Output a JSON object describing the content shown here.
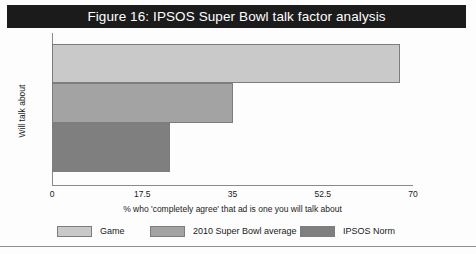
{
  "title": "Figure 16: IPSOS Super Bowl talk factor analysis",
  "colors": {
    "title_bar_background": "#1b1b1b",
    "title_bar_text": "#ffffff",
    "axis_line": "#8a8a8a",
    "bar_outline": "#7d7d7d",
    "game": "#c9c9c9",
    "super_bowl_average": "#a3a3a3",
    "ipsos_norm": "#7f7f7f"
  },
  "chart_data": {
    "type": "bar",
    "orientation": "horizontal",
    "title": "Figure 16: IPSOS Super Bowl talk factor analysis",
    "xlabel": "% who 'completely agree' that ad is one you will talk about",
    "ylabel": "Will talk about",
    "categories": [
      "Game",
      "2010 Super Bowl average",
      "IPSOS Norm"
    ],
    "values": [
      67.5,
      35,
      22.8
    ],
    "xlim": [
      0,
      70
    ],
    "xticks": [
      0,
      17.5,
      35,
      52.5,
      70
    ],
    "xtick_labels": [
      "0",
      "17.5",
      "35",
      "52.5",
      "70"
    ],
    "ytick_labels": [],
    "grid": false,
    "legend_position": "bottom",
    "series": [
      {
        "name": "Game",
        "value": 67.5,
        "color": "#c9c9c9"
      },
      {
        "name": "2010 Super Bowl average",
        "value": 35,
        "color": "#a3a3a3"
      },
      {
        "name": "IPSOS Norm",
        "value": 22.8,
        "color": "#7f7f7f"
      }
    ]
  },
  "legend": {
    "items": [
      {
        "label": "Game",
        "color": "#c9c9c9"
      },
      {
        "label": "2010 Super Bowl average",
        "color": "#a3a3a3"
      },
      {
        "label": "IPSOS Norm",
        "color": "#7f7f7f"
      }
    ]
  }
}
